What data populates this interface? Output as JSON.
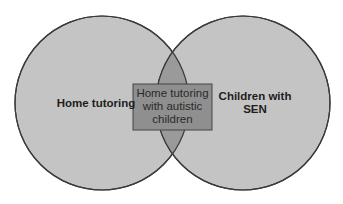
{
  "diagram": {
    "type": "venn",
    "sets": [
      {
        "id": "left",
        "label": "Home tutoring"
      },
      {
        "id": "right",
        "label_line1": "Children with",
        "label_line2": "SEN"
      }
    ],
    "intersection": {
      "line1": "Home tutoring",
      "line2": "with autistic",
      "line3": "children"
    },
    "colors": {
      "circle_fill": "#c4c4c4",
      "circle_stroke": "#3a3a3a",
      "intersection_fill": "#9a9a9a",
      "box_fill": "#8f8f8f",
      "box_stroke": "#444444",
      "text": "#1e1e1e"
    }
  }
}
